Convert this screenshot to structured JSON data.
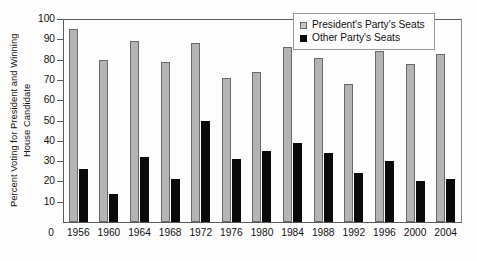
{
  "chart_data": {
    "type": "bar",
    "title": "",
    "xlabel": "",
    "ylabel": "Percent Voting for President and Winning House Candidate",
    "ylabel_lines": [
      "Percent Voting for President and Winning",
      "House Candidate"
    ],
    "ylim": [
      0,
      100
    ],
    "yticks": [
      0,
      10,
      20,
      30,
      40,
      50,
      60,
      70,
      80,
      90,
      100
    ],
    "grid": false,
    "legend_position": "top-right",
    "categories": [
      "1956",
      "1960",
      "1964",
      "1968",
      "1972",
      "1976",
      "1980",
      "1984",
      "1988",
      "1992",
      "1996",
      "2000",
      "2004"
    ],
    "series": [
      {
        "name": "President's Party's Seats",
        "color": "#b4b4b4",
        "values": [
          95,
          80,
          89,
          79,
          88,
          71,
          74,
          86,
          81,
          68,
          84,
          78,
          83
        ]
      },
      {
        "name": "Other Party's Seats",
        "color": "#0a0a0a",
        "values": [
          26,
          14,
          32,
          21,
          50,
          31,
          35,
          39,
          34,
          24,
          30,
          20,
          21
        ]
      }
    ]
  },
  "legend": {
    "items": [
      {
        "label": "President's Party's Seats",
        "swatch": "light-gray-square"
      },
      {
        "label": "Other Party's Seats",
        "swatch": "black-square"
      }
    ]
  },
  "axis": {
    "y_zero_label": "0"
  }
}
